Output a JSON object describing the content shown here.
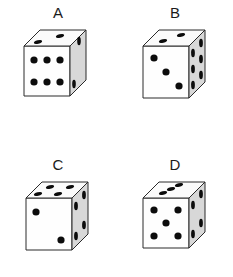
{
  "figure": {
    "type": "dice-comparison",
    "layout": "2x2-grid",
    "background_color": "#ffffff",
    "pip_color": "#0c0c0c",
    "face_front_color": "#fefefe",
    "face_top_color": "#fbfbfb",
    "face_right_color": "#d8d8d8",
    "outline_color": "#2a2a2a"
  },
  "dice": [
    {
      "label": "A",
      "position": "top-left",
      "front_face": 6,
      "top_face": 2,
      "right_face": 2,
      "visible_total": 10
    },
    {
      "label": "B",
      "position": "top-right",
      "front_face": 3,
      "top_face": 2,
      "right_face": 6,
      "visible_total": 11
    },
    {
      "label": "C",
      "position": "bottom-left",
      "front_face": 2,
      "top_face": 4,
      "right_face": 4,
      "visible_total": 10
    },
    {
      "label": "D",
      "position": "bottom-right",
      "front_face": 5,
      "top_face": 3,
      "right_face": 4,
      "visible_total": 12
    }
  ]
}
